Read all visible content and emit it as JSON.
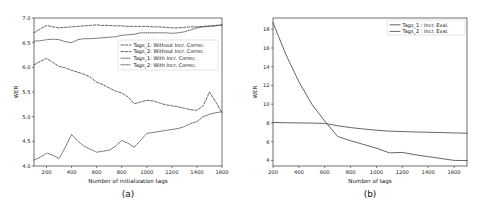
{
  "figure": {
    "panel_a_label": "(a)",
    "panel_b_label": "(b)"
  },
  "chart_data": [
    {
      "id": "panel-a",
      "type": "line",
      "title": "",
      "xlabel": "Number of initialization tags",
      "ylabel": "WER",
      "xlim": [
        100,
        1600
      ],
      "ylim": [
        4.0,
        7.0
      ],
      "xticks": [
        200,
        400,
        600,
        800,
        1000,
        1200,
        1400,
        1600
      ],
      "yticks": [
        4.0,
        4.5,
        5.0,
        5.5,
        6.0,
        6.5,
        7.0
      ],
      "ytick_labels": [
        "4.0",
        "4.5",
        "5.0",
        "5.5",
        "6.0",
        "6.5",
        "7.0"
      ],
      "xtick_labels": [
        "200",
        "400",
        "600",
        "800",
        "1000",
        "1200",
        "1400",
        "1600"
      ],
      "grid": false,
      "legend_position": "center-right",
      "x": [
        100,
        150,
        200,
        250,
        300,
        350,
        400,
        450,
        500,
        550,
        600,
        650,
        700,
        750,
        800,
        850,
        900,
        950,
        1000,
        1050,
        1100,
        1150,
        1200,
        1250,
        1300,
        1350,
        1400,
        1450,
        1500,
        1550,
        1600
      ],
      "series": [
        {
          "name": "Tags_1: Without Incr. Correc.",
          "style": "dashed",
          "values": [
            6.05,
            6.12,
            6.18,
            6.1,
            6.02,
            5.99,
            5.94,
            5.9,
            5.86,
            5.8,
            5.7,
            5.65,
            5.58,
            5.52,
            5.48,
            5.4,
            5.26,
            5.3,
            5.33,
            5.32,
            5.28,
            5.24,
            5.22,
            5.2,
            5.17,
            5.14,
            5.13,
            5.22,
            5.5,
            5.3,
            5.08
          ]
        },
        {
          "name": "Tags_2: Without Incr. Correc.",
          "style": "dashed",
          "values": [
            6.7,
            6.78,
            6.85,
            6.82,
            6.8,
            6.81,
            6.82,
            6.83,
            6.84,
            6.85,
            6.86,
            6.85,
            6.85,
            6.84,
            6.84,
            6.83,
            6.83,
            6.83,
            6.83,
            6.82,
            6.82,
            6.81,
            6.8,
            6.8,
            6.81,
            6.82,
            6.82,
            6.83,
            6.84,
            6.85,
            6.86
          ]
        },
        {
          "name": "Tags_1: With Incr. Correc.",
          "style": "dotted",
          "values": [
            4.12,
            4.18,
            4.26,
            4.22,
            4.15,
            4.38,
            4.64,
            4.5,
            4.4,
            4.34,
            4.28,
            4.3,
            4.32,
            4.4,
            4.52,
            4.46,
            4.38,
            4.52,
            4.66,
            4.68,
            4.7,
            4.72,
            4.74,
            4.76,
            4.8,
            4.86,
            4.9,
            5.0,
            5.05,
            5.08,
            5.1
          ]
        },
        {
          "name": "Tags_2: With Incr. Correc.",
          "style": "dotted",
          "values": [
            6.53,
            6.54,
            6.56,
            6.57,
            6.56,
            6.52,
            6.5,
            6.56,
            6.58,
            6.58,
            6.59,
            6.6,
            6.61,
            6.62,
            6.65,
            6.66,
            6.67,
            6.7,
            6.7,
            6.7,
            6.7,
            6.7,
            6.69,
            6.7,
            6.72,
            6.76,
            6.8,
            6.82,
            6.83,
            6.84,
            6.86
          ]
        }
      ]
    },
    {
      "id": "panel-b",
      "type": "line",
      "title": "",
      "xlabel": "Number of tags",
      "ylabel": "WER",
      "xlim": [
        200,
        1700
      ],
      "ylim": [
        3.4,
        19.2
      ],
      "xticks": [
        200,
        400,
        600,
        800,
        1000,
        1200,
        1400,
        1600
      ],
      "yticks": [
        4,
        6,
        8,
        10,
        12,
        14,
        16,
        18
      ],
      "ytick_labels": [
        "4",
        "6",
        "8",
        "10",
        "12",
        "14",
        "16",
        "18"
      ],
      "xtick_labels": [
        "200",
        "400",
        "600",
        "800",
        "1000",
        "1200",
        "1400",
        "1600"
      ],
      "grid": false,
      "legend_position": "upper-right",
      "x": [
        200,
        300,
        400,
        500,
        600,
        700,
        800,
        900,
        1000,
        1100,
        1200,
        1300,
        1400,
        1500,
        1600,
        1700
      ],
      "series": [
        {
          "name": "Tags_1 : Incr. Eval.",
          "style": "solid",
          "values": [
            8.05,
            8.02,
            8.0,
            7.98,
            7.95,
            7.7,
            7.5,
            7.35,
            7.22,
            7.12,
            7.08,
            7.03,
            7.0,
            6.97,
            6.93,
            6.9
          ]
        },
        {
          "name": "Tags_2 : Incr. Eval.",
          "style": "solid",
          "values": [
            18.7,
            15.3,
            12.4,
            10.0,
            8.2,
            6.55,
            6.1,
            5.7,
            5.3,
            4.8,
            4.85,
            4.6,
            4.4,
            4.2,
            4.0,
            3.98
          ]
        }
      ]
    }
  ]
}
